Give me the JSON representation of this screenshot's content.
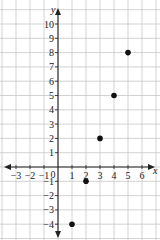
{
  "chart_data": {
    "type": "scatter",
    "title": "",
    "xlabel": "x",
    "ylabel": "y",
    "xlim": [
      -3,
      6
    ],
    "ylim": [
      -4,
      10
    ],
    "grid": true,
    "x_ticks": [
      -3,
      -2,
      -1,
      0,
      1,
      2,
      3,
      4,
      5,
      6
    ],
    "y_ticks": [
      -4,
      -3,
      -2,
      -1,
      1,
      2,
      3,
      4,
      5,
      6,
      7,
      8,
      9,
      10
    ],
    "points": [
      {
        "x": 1,
        "y": -4
      },
      {
        "x": 2,
        "y": -1
      },
      {
        "x": 3,
        "y": 2
      },
      {
        "x": 4,
        "y": 5
      },
      {
        "x": 5,
        "y": 8
      }
    ],
    "colors": {
      "grid": "#c8c8c8",
      "axis": "#222222",
      "point": "#111111"
    }
  },
  "labels": {
    "x_axis": "x",
    "y_axis": "y",
    "origin": "0"
  }
}
